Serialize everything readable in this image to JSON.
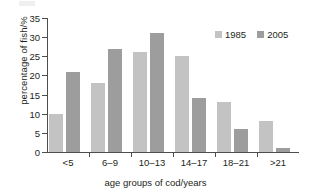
{
  "chart_data": {
    "type": "bar",
    "title": "",
    "xlabel": "age groups of cod/years",
    "ylabel": "percentage of fish/%",
    "categories": [
      "<5",
      "6–9",
      "10–13",
      "14–17",
      "18–21",
      ">21"
    ],
    "series": [
      {
        "name": "1985",
        "color": "#c3c3c3",
        "values": [
          10,
          18,
          26,
          25,
          13,
          8
        ]
      },
      {
        "name": "2005",
        "color": "#9d9d9d",
        "values": [
          21,
          27,
          31,
          14,
          6,
          1
        ]
      }
    ],
    "ylim": [
      0,
      35
    ],
    "yticks": [
      0,
      5,
      10,
      15,
      20,
      25,
      30,
      35
    ],
    "ytick_labels": [
      "0",
      "5",
      "10",
      "15",
      "20",
      "25",
      "30",
      "35"
    ],
    "grid": false,
    "legend_position": "top-right",
    "legend_entries": [
      "1985",
      "2005"
    ],
    "axis_color": "#4d4d4d"
  }
}
